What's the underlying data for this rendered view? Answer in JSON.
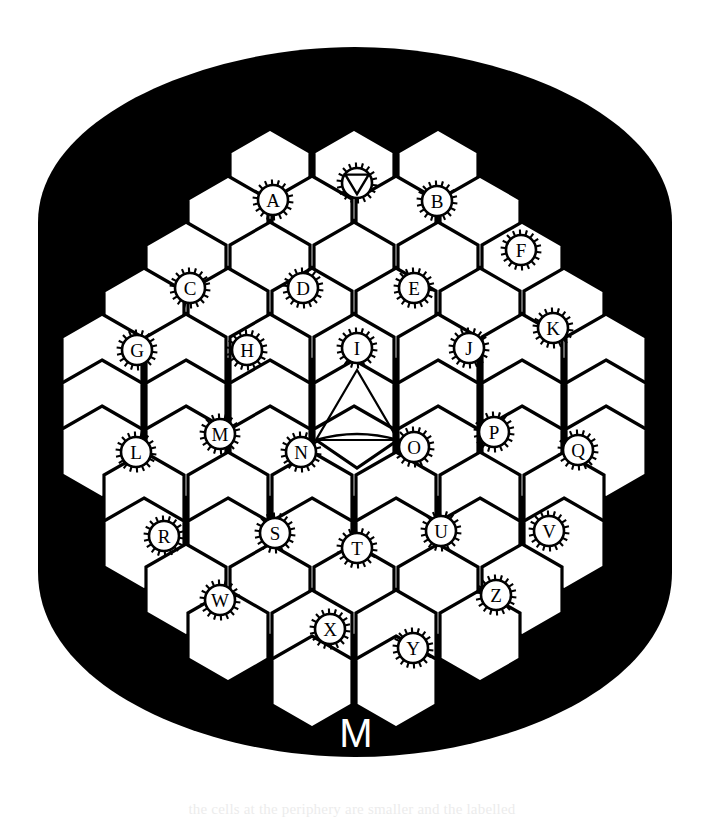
{
  "figure": {
    "kind": "hexagonal-comb-map",
    "caption_bleed": "the cells at the periphery are smaller and the labelled",
    "background_color": "#000000",
    "cell_fill": "#ffffff",
    "line_color": "#000000",
    "bottom_marker": "M",
    "page_background": "#ffffff"
  },
  "geometry": {
    "hex_width": 80,
    "hex_height": 92,
    "stroke_width": 3.2,
    "marker_radius": 15,
    "marker_spikes": 18,
    "origin_x": 68,
    "origin_y": 110
  },
  "blob": {
    "description": "rounded black background blob",
    "top_y": 47,
    "bottom_y": 757,
    "left_x": 38,
    "right_x": 672
  },
  "markers": [
    {
      "id": "A",
      "label": "A",
      "x": 273,
      "y": 200,
      "type": "letter"
    },
    {
      "id": "V-top",
      "label": "V",
      "x": 357,
      "y": 183,
      "type": "triangle"
    },
    {
      "id": "B",
      "label": "B",
      "x": 437,
      "y": 201,
      "type": "letter"
    },
    {
      "id": "F",
      "label": "F",
      "x": 521,
      "y": 250,
      "type": "letter"
    },
    {
      "id": "C",
      "label": "C",
      "x": 190,
      "y": 288,
      "type": "letter"
    },
    {
      "id": "D",
      "label": "D",
      "x": 303,
      "y": 288,
      "type": "letter"
    },
    {
      "id": "E",
      "label": "E",
      "x": 414,
      "y": 288,
      "type": "letter"
    },
    {
      "id": "K",
      "label": "K",
      "x": 553,
      "y": 328,
      "type": "letter"
    },
    {
      "id": "G",
      "label": "G",
      "x": 137,
      "y": 350,
      "type": "letter"
    },
    {
      "id": "H",
      "label": "H",
      "x": 247,
      "y": 350,
      "type": "letter"
    },
    {
      "id": "I",
      "label": "I",
      "x": 357,
      "y": 348,
      "type": "letter"
    },
    {
      "id": "J",
      "label": "J",
      "x": 469,
      "y": 348,
      "type": "letter"
    },
    {
      "id": "M",
      "label": "M",
      "x": 220,
      "y": 434,
      "type": "letter"
    },
    {
      "id": "P",
      "label": "P",
      "x": 494,
      "y": 432,
      "type": "letter"
    },
    {
      "id": "L",
      "label": "L",
      "x": 136,
      "y": 452,
      "type": "letter"
    },
    {
      "id": "N",
      "label": "N",
      "x": 301,
      "y": 452,
      "type": "letter"
    },
    {
      "id": "O",
      "label": "O",
      "x": 414,
      "y": 447,
      "type": "letter"
    },
    {
      "id": "Q",
      "label": "Q",
      "x": 578,
      "y": 450,
      "type": "letter"
    },
    {
      "id": "R",
      "label": "R",
      "x": 164,
      "y": 536,
      "type": "letter"
    },
    {
      "id": "S",
      "label": "S",
      "x": 275,
      "y": 533,
      "type": "letter"
    },
    {
      "id": "U",
      "label": "U",
      "x": 441,
      "y": 531,
      "type": "letter"
    },
    {
      "id": "V",
      "label": "V",
      "x": 549,
      "y": 531,
      "type": "letter"
    },
    {
      "id": "T",
      "label": "T",
      "x": 357,
      "y": 548,
      "type": "letter"
    },
    {
      "id": "W",
      "label": "W",
      "x": 220,
      "y": 600,
      "type": "letter"
    },
    {
      "id": "Z",
      "label": "Z",
      "x": 496,
      "y": 595,
      "type": "letter"
    },
    {
      "id": "X",
      "label": "X",
      "x": 330,
      "y": 629,
      "type": "letter"
    },
    {
      "id": "Y",
      "label": "Y",
      "x": 413,
      "y": 648,
      "type": "letter"
    }
  ],
  "center_glyph": {
    "label": "triangle-with-arc",
    "apex_x": 357,
    "apex_y": 370,
    "left_x": 316,
    "left_y": 440,
    "right_x": 398,
    "right_y": 440,
    "lower_tip_x": 357,
    "lower_tip_y": 468
  },
  "cells": {
    "note": "hexagon cell centres in axial rows; pointy-top orientation",
    "rows": [
      {
        "row": 0,
        "y": 175,
        "xs": [
          270,
          354,
          438
        ]
      },
      {
        "row": 1,
        "y": 222,
        "xs": [
          228,
          312,
          396,
          480
        ]
      },
      {
        "row": 2,
        "y": 268,
        "xs": [
          186,
          270,
          354,
          438,
          522
        ]
      },
      {
        "row": 3,
        "y": 314,
        "xs": [
          144,
          228,
          312,
          396,
          480,
          564
        ]
      },
      {
        "row": 4,
        "y": 360,
        "xs": [
          102,
          186,
          270,
          354,
          438,
          522,
          606
        ]
      },
      {
        "row": 5,
        "y": 406,
        "xs": [
          102,
          186,
          270,
          354,
          438,
          522,
          606
        ]
      },
      {
        "row": 6,
        "y": 452,
        "xs": [
          102,
          186,
          270,
          354,
          438,
          522,
          606
        ]
      },
      {
        "row": 7,
        "y": 498,
        "xs": [
          144,
          228,
          312,
          396,
          480,
          564
        ]
      },
      {
        "row": 8,
        "y": 544,
        "xs": [
          144,
          228,
          312,
          396,
          480,
          564
        ]
      },
      {
        "row": 9,
        "y": 590,
        "xs": [
          186,
          270,
          354,
          438,
          522
        ]
      },
      {
        "row": 10,
        "y": 636,
        "xs": [
          228,
          312,
          396,
          480
        ]
      },
      {
        "row": 11,
        "y": 682,
        "xs": [
          312,
          396
        ]
      }
    ]
  }
}
